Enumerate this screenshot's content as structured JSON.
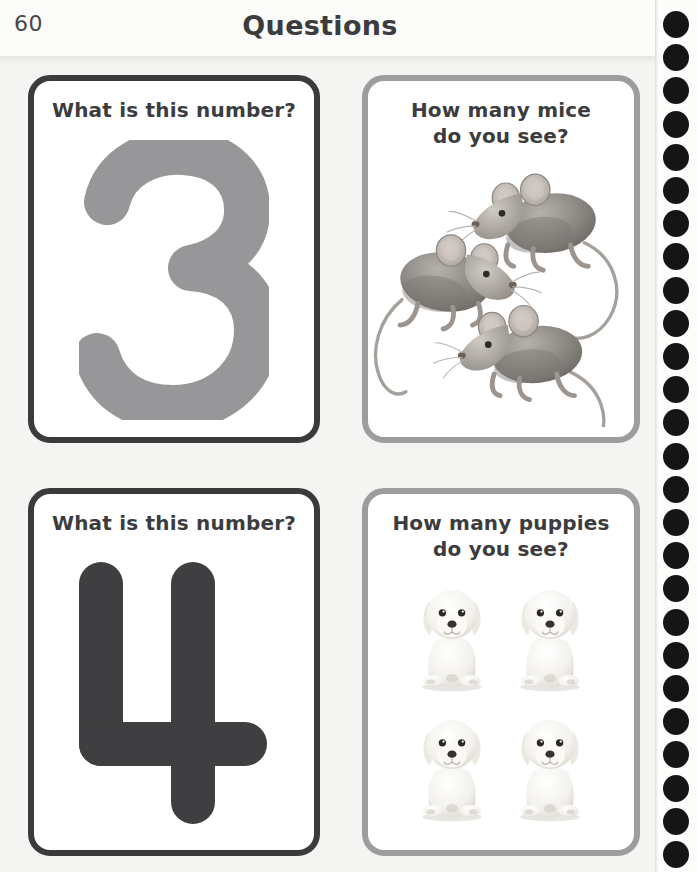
{
  "header": {
    "page_number": "60",
    "title": "Questions"
  },
  "binding": {
    "hole_icon": "spiral-binding-hole",
    "hole_count": 26,
    "hole_color": "#151515"
  },
  "colors": {
    "page_background": "#f4f4f2",
    "header_background": "#fbfbfa",
    "card_background": "#ffffff",
    "card_border_dark": "#3b3b3d",
    "card_border_light": "#9d9d9f",
    "text_dark": "#3c3c3e",
    "numeral_gray": "#979799",
    "numeral_charcoal": "#3f3f41",
    "mouse_body": "#8e8a86",
    "puppy_body": "#f4f2ee"
  },
  "cards": [
    {
      "id": "card-number-three",
      "position": "top-left",
      "border_style": "dark",
      "title": "What is this number?",
      "content_type": "numeral",
      "numeral": "3",
      "numeral_color": "#979799"
    },
    {
      "id": "card-count-mice",
      "position": "top-right",
      "border_style": "light",
      "title": "How many mice\ndo you see?",
      "content_type": "illustration",
      "subject": "mice",
      "subject_icon": "mouse-illustration",
      "count": 3
    },
    {
      "id": "card-number-four",
      "position": "bottom-left",
      "border_style": "dark",
      "title": "What is this number?",
      "content_type": "numeral",
      "numeral": "4",
      "numeral_color": "#3f3f41"
    },
    {
      "id": "card-count-puppies",
      "position": "bottom-right",
      "border_style": "light",
      "title": "How many puppies\ndo you see?",
      "content_type": "illustration",
      "subject": "puppies",
      "subject_icon": "puppy-illustration",
      "count": 4
    }
  ]
}
